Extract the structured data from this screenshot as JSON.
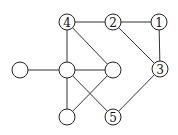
{
  "diagram": {
    "type": "graph",
    "nodes": [
      {
        "id": "n4",
        "label": "4",
        "x": 67,
        "y": 22
      },
      {
        "id": "n2",
        "label": "2",
        "x": 113,
        "y": 22
      },
      {
        "id": "n1",
        "label": "1",
        "x": 159,
        "y": 22
      },
      {
        "id": "nL",
        "label": "",
        "x": 20,
        "y": 70
      },
      {
        "id": "nC",
        "label": "",
        "x": 67,
        "y": 70
      },
      {
        "id": "nM",
        "label": "",
        "x": 113,
        "y": 70
      },
      {
        "id": "n3",
        "label": "3",
        "x": 160,
        "y": 69
      },
      {
        "id": "nB",
        "label": "",
        "x": 67,
        "y": 117
      },
      {
        "id": "n5",
        "label": "5",
        "x": 113,
        "y": 117
      }
    ],
    "edges": [
      [
        "n4",
        "n2"
      ],
      [
        "n2",
        "n1"
      ],
      [
        "n1",
        "n3"
      ],
      [
        "n2",
        "n3"
      ],
      [
        "n3",
        "n5"
      ],
      [
        "n4",
        "nC"
      ],
      [
        "n4",
        "nM"
      ],
      [
        "nL",
        "nC"
      ],
      [
        "nC",
        "nM"
      ],
      [
        "nC",
        "nB"
      ],
      [
        "nC",
        "n5"
      ],
      [
        "nM",
        "nB"
      ]
    ],
    "node_radius": 8
  }
}
